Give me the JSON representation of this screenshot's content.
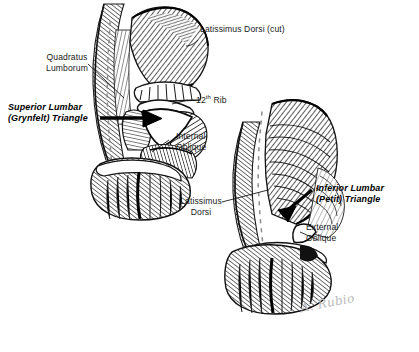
{
  "figure": {
    "background_color": "#ffffff",
    "ink_color": "#1a1a1a",
    "width": 419,
    "height": 352,
    "style": "pen-and-ink anatomical illustration, two posterolateral trunk views"
  },
  "labels": {
    "quadratus_lumborum": "Quadratus\nLumborum",
    "superior_lumbar_triangle": "Superior Lumbar\n(Grynfelt) Triangle",
    "latissimus_dorsi_cut": "Latissimus Dorsi (cut)",
    "twelfth_rib_number": "12",
    "twelfth_rib_ordinal": "th",
    "twelfth_rib_word": "Rib",
    "internal_oblique": "Internal\nOblique",
    "latissimus_dorsi": "Latissimus\nDorsi",
    "inferior_lumbar_triangle": "Inferior Lumbar\n(Petit) Triangle",
    "external_oblique": "External\nOblique"
  },
  "signature": {
    "text": "A. Rubio",
    "color": "#b9b9bd"
  },
  "annotations": [
    {
      "name": "quadratus-lumborum",
      "style": "plain",
      "leader": "thin-line",
      "points_to": "deep muscle medial to spine, left figure"
    },
    {
      "name": "superior-lumbar-grynfelt-triangle",
      "style": "bold-italic",
      "leader": "thick-arrow",
      "points_to": "white triangular gap below 12th rib, left figure"
    },
    {
      "name": "latissimus-dorsi-cut",
      "style": "plain",
      "leader": "thin-line",
      "points_to": "reflected latissimus edge, upper right of left figure"
    },
    {
      "name": "twelfth-rib",
      "style": "plain",
      "leader": "thin-line",
      "points_to": "rib forming superior border of Grynfelt triangle"
    },
    {
      "name": "internal-oblique",
      "style": "plain",
      "leader": "thin-line",
      "points_to": "internal oblique muscle belly, left figure"
    },
    {
      "name": "latissimus-dorsi",
      "style": "plain",
      "leader": "thin-line",
      "points_to": "latissimus dorsi sheet, right figure"
    },
    {
      "name": "inferior-lumbar-petit-triangle",
      "style": "bold-italic",
      "leader": "thick-arrow",
      "points_to": "triangle above iliac crest, right figure"
    },
    {
      "name": "external-oblique",
      "style": "plain",
      "leader": "thin-line",
      "points_to": "external oblique muscle, right figure"
    }
  ]
}
